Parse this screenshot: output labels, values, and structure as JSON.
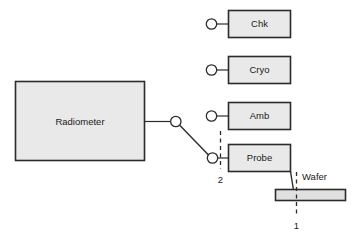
{
  "diagram": {
    "colors": {
      "box_fill": "#e9e9e9",
      "wafer_fill": "#e0e0e0",
      "stroke": "#2b2b2b",
      "background": "#ffffff"
    },
    "blocks": {
      "radiometer": {
        "label": "Radiometer"
      },
      "chk": {
        "label": "Chk"
      },
      "cryo": {
        "label": "Cryo"
      },
      "amb": {
        "label": "Amb"
      },
      "probe": {
        "label": "Probe"
      },
      "wafer": {
        "label": "Wafer"
      }
    },
    "reference_planes": {
      "plane_two": {
        "label": "2"
      },
      "plane_one": {
        "label": "1"
      }
    }
  }
}
